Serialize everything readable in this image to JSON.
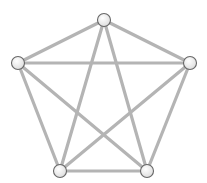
{
  "diagram": {
    "type": "complete-graph",
    "label": "K5",
    "colors": {
      "edge": "#b4b4b4",
      "node_fill": "#f4f4f4",
      "node_stroke": "#666666",
      "background": "#ffffff"
    },
    "nodes": [
      {
        "id": "top",
        "x": 104,
        "y": 20
      },
      {
        "id": "left",
        "x": 18,
        "y": 63
      },
      {
        "id": "right",
        "x": 190,
        "y": 63
      },
      {
        "id": "bottom-left",
        "x": 60,
        "y": 171
      },
      {
        "id": "bottom-right",
        "x": 147,
        "y": 171
      }
    ],
    "edges": [
      [
        "top",
        "left"
      ],
      [
        "top",
        "right"
      ],
      [
        "top",
        "bottom-left"
      ],
      [
        "top",
        "bottom-right"
      ],
      [
        "left",
        "right"
      ],
      [
        "left",
        "bottom-left"
      ],
      [
        "left",
        "bottom-right"
      ],
      [
        "right",
        "bottom-left"
      ],
      [
        "right",
        "bottom-right"
      ],
      [
        "bottom-left",
        "bottom-right"
      ]
    ]
  }
}
